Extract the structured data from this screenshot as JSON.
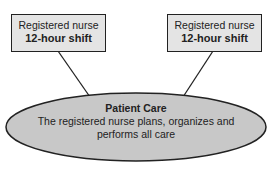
{
  "diagram": {
    "left_box": {
      "line1": "Registered nurse",
      "line2": "12-hour shift"
    },
    "right_box": {
      "line1": "Registered nurse",
      "line2": "12-hour shift"
    },
    "center": {
      "title": "Patient Care",
      "line1": "The registered nurse plans, organizes and",
      "line2": "performs all care"
    },
    "colors": {
      "fill": "#e4e4e4",
      "stroke": "#222222",
      "ellipse_fill": "#c8c8c8"
    }
  }
}
